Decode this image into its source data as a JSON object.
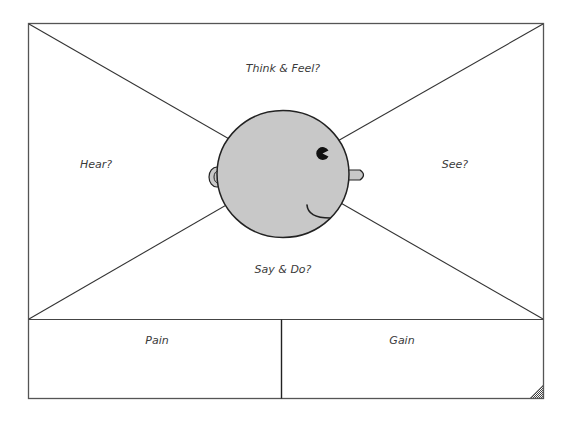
{
  "diagram": {
    "type": "empathy-map",
    "quadrants": {
      "top": "Think & Feel?",
      "left": "Hear?",
      "right": "See?",
      "bottom": "Say & Do?"
    },
    "bottom_panels": {
      "left": "Pain",
      "right": "Gain"
    },
    "head": {
      "fill": "#c8c8c8",
      "stroke": "#222222",
      "features": [
        "eye",
        "ear",
        "nose",
        "mouth"
      ]
    },
    "colors": {
      "frame": "#555555",
      "lines": "#333333",
      "text": "#3a3a3a"
    }
  }
}
